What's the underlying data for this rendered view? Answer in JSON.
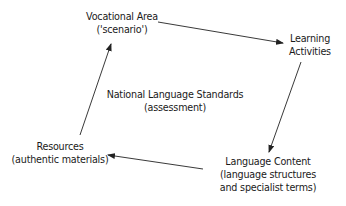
{
  "diagram": {
    "type": "cycle",
    "colors": {
      "text": "#1a1a1a",
      "arrow": "#222222",
      "background": "#ffffff"
    },
    "nodes": {
      "vocational": {
        "line1": "Vocational Area",
        "line2": "('scenario')"
      },
      "learning": {
        "line1": "Learning",
        "line2": "Activities"
      },
      "content": {
        "line1": "Language Content",
        "line2": "(language structures",
        "line3": "and specialist terms)"
      },
      "resources": {
        "line1": "Resources",
        "line2": "(authentic materials)"
      },
      "center": {
        "line1": "National Language Standards",
        "line2": "(assessment)"
      }
    },
    "edges": [
      {
        "from": "Vocational Area",
        "to": "Learning Activities"
      },
      {
        "from": "Learning Activities",
        "to": "Language Content"
      },
      {
        "from": "Language Content",
        "to": "Resources"
      },
      {
        "from": "Resources",
        "to": "Vocational Area"
      }
    ]
  }
}
